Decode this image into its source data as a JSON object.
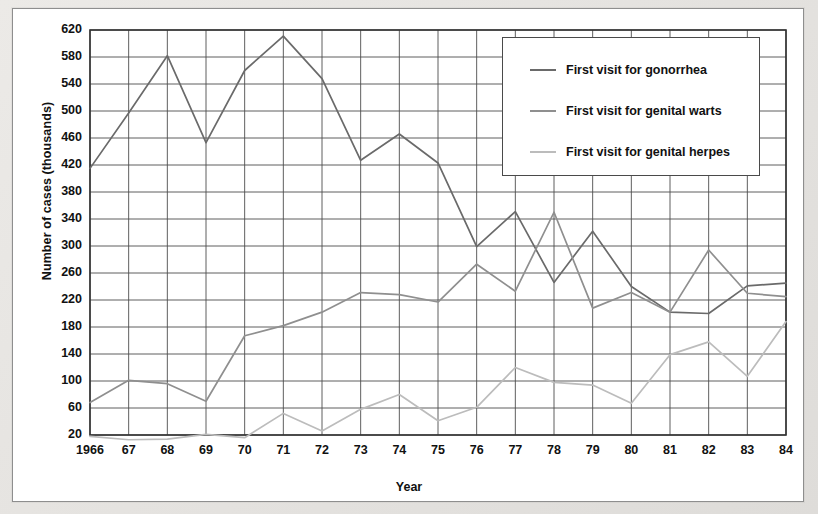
{
  "figure": {
    "background_color": "#ffffff",
    "page_color": "#e9e7e4",
    "frame_border_color": "#8e8e8e"
  },
  "axes": {
    "y_title": "Number of cases (thousands)",
    "x_title": "Year",
    "y_ticks": [
      "620",
      "580",
      "540",
      "500",
      "460",
      "420",
      "380",
      "340",
      "300",
      "260",
      "220",
      "180",
      "140",
      "100",
      "60",
      "20"
    ],
    "x_ticks": [
      "1966",
      "67",
      "68",
      "69",
      "70",
      "71",
      "72",
      "73",
      "74",
      "75",
      "76",
      "77",
      "78",
      "79",
      "80",
      "81",
      "82",
      "83",
      "84"
    ],
    "grid": "on",
    "grid_color": "#4d4d4d"
  },
  "legend": {
    "position": "top-right",
    "border_color": "#4a4a4a",
    "items": [
      {
        "label": "First visit for gonorrhea",
        "color": "#6a6a6a"
      },
      {
        "label": "First visit for genital warts",
        "color": "#8f8f8f"
      },
      {
        "label": "First visit for genital herpes",
        "color": "#bcbcbc"
      }
    ]
  },
  "chart_data": {
    "type": "line",
    "title": "",
    "xlabel": "Year",
    "ylabel": "Number of cases (thousands)",
    "xlim": [
      1966,
      1984
    ],
    "ylim": [
      0,
      620
    ],
    "ytick_step": 40,
    "grid": "on",
    "legend_position": "top-right",
    "x": [
      1966,
      1967,
      1968,
      1969,
      1970,
      1971,
      1972,
      1973,
      1974,
      1975,
      1976,
      1977,
      1978,
      1979,
      1980,
      1981,
      1982,
      1983,
      1984
    ],
    "categories": [
      "1966",
      "67",
      "68",
      "69",
      "70",
      "71",
      "72",
      "73",
      "74",
      "75",
      "76",
      "77",
      "78",
      "79",
      "80",
      "81",
      "82",
      "83",
      "84"
    ],
    "series": [
      {
        "name": "First visit for gonorrhea",
        "color": "#6a6a6a",
        "values": [
          415,
          497,
          582,
          453,
          560,
          611,
          548,
          427,
          466,
          423,
          299,
          351,
          246,
          322,
          240,
          202,
          200,
          241,
          245
        ]
      },
      {
        "name": "First visit for genital warts",
        "color": "#8f8f8f",
        "values": [
          68,
          101,
          96,
          70,
          167,
          182,
          202,
          231,
          228,
          217,
          273,
          233,
          350,
          208,
          231,
          202,
          294,
          230,
          225
        ]
      },
      {
        "name": "First visit for genital herpes",
        "color": "#bcbcbc",
        "values": [
          18,
          13,
          14,
          21,
          16,
          52,
          26,
          58,
          80,
          41,
          61,
          120,
          98,
          94,
          67,
          139,
          158,
          107,
          188
        ]
      }
    ]
  }
}
